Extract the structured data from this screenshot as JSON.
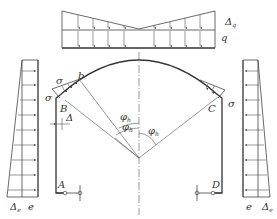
{
  "figure": {
    "labels": {
      "delta_q": "Δ",
      "delta_q_sub": "q",
      "q": "q",
      "sigma_left_top": "σ",
      "sigma_left_side": "σ",
      "sigma_right": "σ",
      "b": "b",
      "B": "B",
      "C": "C",
      "A": "A",
      "D": "D",
      "delta": "Δ",
      "phi": "φ",
      "phi_sub": "h",
      "delta_e_left": "Δ",
      "delta_e_left_sub": "e",
      "e_left": "e",
      "e_right": "e",
      "delta_e_right": "Δ",
      "delta_e_right_sub": "e"
    },
    "colors": {
      "line": "#444444",
      "background": "#ffffff"
    }
  }
}
